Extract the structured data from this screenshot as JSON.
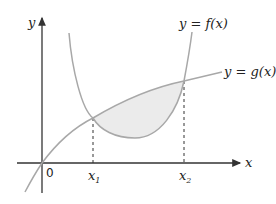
{
  "diagram": {
    "axes": {
      "x_label": "x",
      "y_label": "y",
      "origin_label": "0"
    },
    "curves": [
      {
        "name": "f",
        "label": "y = f(x)",
        "shape": "U-shaped (convex)"
      },
      {
        "name": "g",
        "label": "y = g(x)",
        "shape": "concave increasing through origin"
      }
    ],
    "intersections": [
      {
        "label": "x",
        "subscript": "1"
      },
      {
        "label": "x",
        "subscript": "2"
      }
    ],
    "shaded_region": "area between g(x) (above) and f(x) (below) from x1 to x2",
    "colors": {
      "axis": "#333333",
      "curve": "#a8a8a8",
      "shade": "#ebebeb"
    }
  }
}
